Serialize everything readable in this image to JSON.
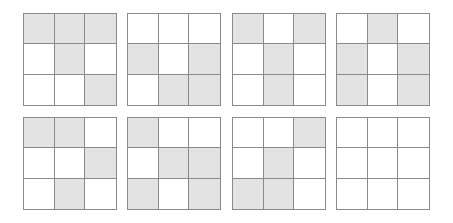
{
  "puzzle": {
    "shaded_color": "#e3e3e3",
    "line_color": "#8a8a8a",
    "grids": [
      {
        "id": 1,
        "cells": [
          [
            1,
            1,
            1
          ],
          [
            0,
            1,
            0
          ],
          [
            0,
            0,
            1
          ]
        ]
      },
      {
        "id": 2,
        "cells": [
          [
            0,
            0,
            0
          ],
          [
            1,
            0,
            1
          ],
          [
            0,
            1,
            1
          ]
        ]
      },
      {
        "id": 3,
        "cells": [
          [
            1,
            0,
            1
          ],
          [
            0,
            1,
            0
          ],
          [
            0,
            1,
            0
          ]
        ]
      },
      {
        "id": 4,
        "cells": [
          [
            0,
            1,
            0
          ],
          [
            1,
            0,
            1
          ],
          [
            1,
            0,
            1
          ]
        ]
      },
      {
        "id": 5,
        "cells": [
          [
            1,
            1,
            0
          ],
          [
            0,
            0,
            1
          ],
          [
            0,
            1,
            0
          ]
        ]
      },
      {
        "id": 6,
        "cells": [
          [
            1,
            0,
            0
          ],
          [
            0,
            1,
            1
          ],
          [
            1,
            0,
            1
          ]
        ]
      },
      {
        "id": 7,
        "cells": [
          [
            0,
            0,
            1
          ],
          [
            0,
            1,
            0
          ],
          [
            1,
            1,
            0
          ]
        ]
      },
      {
        "id": 8,
        "cells": [
          [
            0,
            0,
            0
          ],
          [
            0,
            0,
            0
          ],
          [
            0,
            0,
            0
          ]
        ]
      }
    ]
  }
}
